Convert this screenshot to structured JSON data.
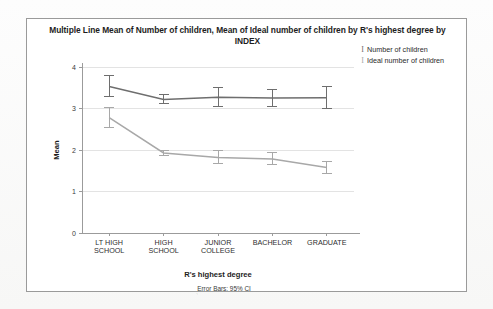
{
  "chart_data": {
    "type": "line",
    "title": "Multiple Line Mean of Number of children, Mean of Ideal number of children by R's highest degree by INDEX",
    "title_line1": "Multiple Line Mean of Number of children, Mean of Ideal number of children by R's highest degree by",
    "title_line2": "INDEX",
    "xlabel": "R's highest degree",
    "ylabel": "Mean",
    "footnote": "Error Bars: 95% CI",
    "categories": [
      "LT HIGH SCHOOL",
      "HIGH SCHOOL",
      "JUNIOR COLLEGE",
      "BACHELOR",
      "GRADUATE"
    ],
    "category_lines": [
      [
        "LT HIGH",
        "SCHOOL"
      ],
      [
        "HIGH",
        "SCHOOL"
      ],
      [
        "JUNIOR",
        "COLLEGE"
      ],
      [
        "BACHELOR",
        ""
      ],
      [
        "GRADUATE",
        ""
      ]
    ],
    "ylim": [
      0,
      4
    ],
    "yticks": [
      0,
      1,
      2,
      3,
      4
    ],
    "ytick_labels": [
      "0",
      "1",
      "2",
      "3",
      "4"
    ],
    "grid": true,
    "grid_axis": "y",
    "legend_position": "top-right",
    "error_bars": "95% CI",
    "series": [
      {
        "name": "Number of children",
        "color": "#6e6e6e",
        "values": [
          3.53,
          3.22,
          3.27,
          3.25,
          3.26
        ],
        "ci_low": [
          3.28,
          3.12,
          3.05,
          3.05,
          3.0
        ],
        "ci_high": [
          3.8,
          3.34,
          3.5,
          3.46,
          3.52
        ]
      },
      {
        "name": "Ideal number of children",
        "color": "#a8a8a8",
        "values": [
          2.78,
          1.93,
          1.82,
          1.78,
          1.58
        ],
        "ci_low": [
          2.55,
          1.86,
          1.67,
          1.64,
          1.44
        ],
        "ci_high": [
          3.02,
          2.0,
          1.98,
          1.93,
          1.73
        ]
      }
    ]
  },
  "legend": {
    "marker_glyph": "I",
    "items": [
      {
        "label": "Number of children",
        "color": "#6e6e6e"
      },
      {
        "label": "Ideal number of children",
        "color": "#a8a8a8"
      }
    ]
  },
  "colors": {
    "card_background": "#ffffff",
    "card_border": "#9a9a9a",
    "page_background": "#fbfbfb",
    "axis": "#9b9b9b",
    "grid": "#e3e3e3",
    "series1": "#6e6e6e",
    "series2": "#a8a8a8"
  }
}
